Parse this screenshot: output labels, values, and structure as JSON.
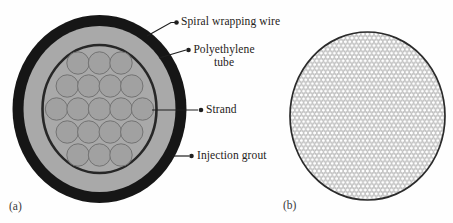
{
  "figure": {
    "panel_a": {
      "caption": "(a)",
      "labels": {
        "spiral_wrapping_wire": "Spiral wrapping wire",
        "polyethylene_tube_line1": "Polyethylene",
        "polyethylene_tube_line2": "tube",
        "strand": "Strand",
        "injection_grout": "Injection grout"
      },
      "strand_count": 19,
      "strand_rows": [
        3,
        4,
        5,
        4,
        3
      ],
      "colors": {
        "wrapping_wire_ring": "#161616",
        "tube_and_grout_gray": "#a9a9a9",
        "tube_boundary_line": "#272727",
        "strand_fill": "#a1a1a1",
        "strand_outline": "#737373",
        "leader_line": "#1f1f1f"
      }
    },
    "panel_b": {
      "caption": "(b)",
      "pattern": "honeycomb wire mesh",
      "colors": {
        "outline": "#2b2b2b",
        "mesh_line": "#949494",
        "background": "#ffffff"
      }
    }
  }
}
